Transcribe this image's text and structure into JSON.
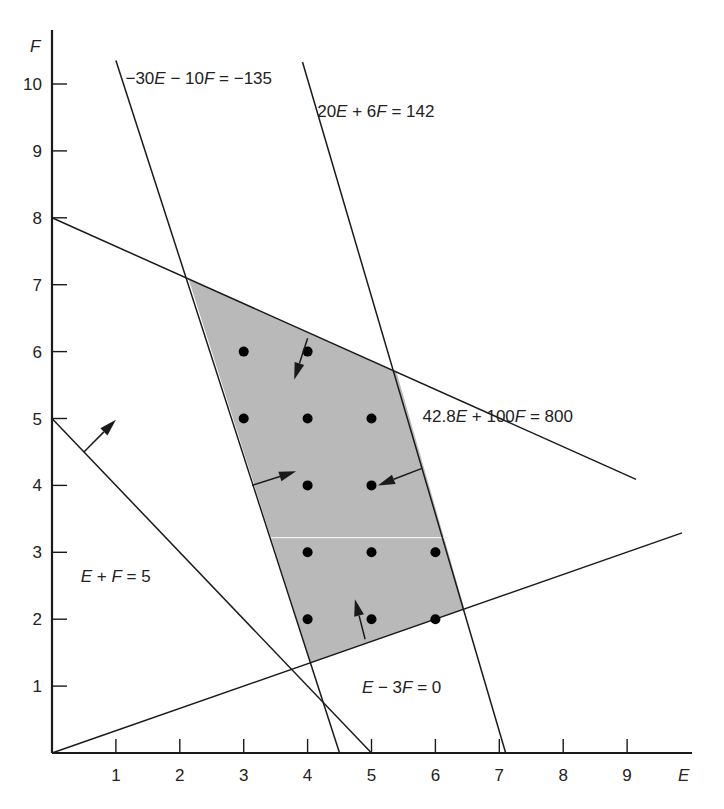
{
  "chart_data": {
    "type": "line",
    "title": "",
    "xlabel": "E",
    "ylabel": "F",
    "xlim": [
      0,
      10
    ],
    "ylim": [
      0,
      10.5
    ],
    "x_ticks": [
      "1",
      "2",
      "3",
      "4",
      "5",
      "6",
      "7",
      "8",
      "9"
    ],
    "y_ticks": [
      "1",
      "2",
      "3",
      "4",
      "5",
      "6",
      "7",
      "8",
      "9",
      "10"
    ],
    "grid": false,
    "legend": null,
    "constraints": [
      {
        "id": "c1",
        "label": "−30E − 10F = −135",
        "a": 30,
        "b": 10,
        "c": 135,
        "segment": [
          [
            1.0,
            10.35
          ],
          [
            4.5,
            0
          ]
        ],
        "label_pos": [
          1.15,
          10.0
        ]
      },
      {
        "id": "c2",
        "label": "20E + 6F = 142",
        "a": 20,
        "b": 6,
        "c": 142,
        "segment": [
          [
            3.92,
            10.33
          ],
          [
            7.1,
            0
          ]
        ],
        "label_pos": [
          4.15,
          9.5
        ]
      },
      {
        "id": "c3",
        "label": "42.8E + 100F = 800",
        "a": 42.8,
        "b": 100,
        "c": 800,
        "segment": [
          [
            0,
            8
          ],
          [
            9.14,
            4.09
          ]
        ],
        "label_pos": [
          5.8,
          4.95
        ]
      },
      {
        "id": "c4",
        "label": "E − 3F = 0",
        "a": 1,
        "b": -3,
        "c": 0,
        "segment": [
          [
            0,
            0
          ],
          [
            9.86,
            3.29
          ]
        ],
        "label_pos": [
          4.85,
          0.9
        ]
      },
      {
        "id": "c5",
        "label": "E + F = 5",
        "a": 1,
        "b": 1,
        "c": 5,
        "segment": [
          [
            0,
            5
          ],
          [
            5,
            0
          ]
        ],
        "label_pos": [
          0.45,
          2.55
        ]
      }
    ],
    "feasible_region": [
      [
        2.138,
        7.085
      ],
      [
        5.392,
        5.692
      ],
      [
        6.455,
        2.152
      ],
      [
        4.05,
        1.35
      ]
    ],
    "integer_points": [
      [
        3,
        6
      ],
      [
        4,
        6
      ],
      [
        3,
        5
      ],
      [
        4,
        5
      ],
      [
        5,
        5
      ],
      [
        4,
        4
      ],
      [
        5,
        4
      ],
      [
        4,
        3
      ],
      [
        5,
        3
      ],
      [
        6,
        3
      ],
      [
        4,
        2
      ],
      [
        5,
        2
      ],
      [
        6,
        2
      ]
    ],
    "arrows": [
      {
        "from": [
          0.5,
          4.5
        ],
        "to": [
          1.0,
          4.98
        ]
      },
      {
        "from": [
          3.13,
          4.0
        ],
        "to": [
          3.82,
          4.21
        ]
      },
      {
        "from": [
          5.78,
          4.25
        ],
        "to": [
          5.1,
          4.0
        ]
      },
      {
        "from": [
          4.0,
          6.2
        ],
        "to": [
          3.79,
          5.58
        ]
      },
      {
        "from": [
          4.9,
          1.7
        ],
        "to": [
          4.74,
          2.3
        ]
      }
    ],
    "colors": {
      "region_fill": "#b9b9b9",
      "line": "#1a1a1a",
      "point": "#000000",
      "background": "#ffffff"
    }
  },
  "axes": {
    "x_label": "E",
    "y_label": "F"
  }
}
